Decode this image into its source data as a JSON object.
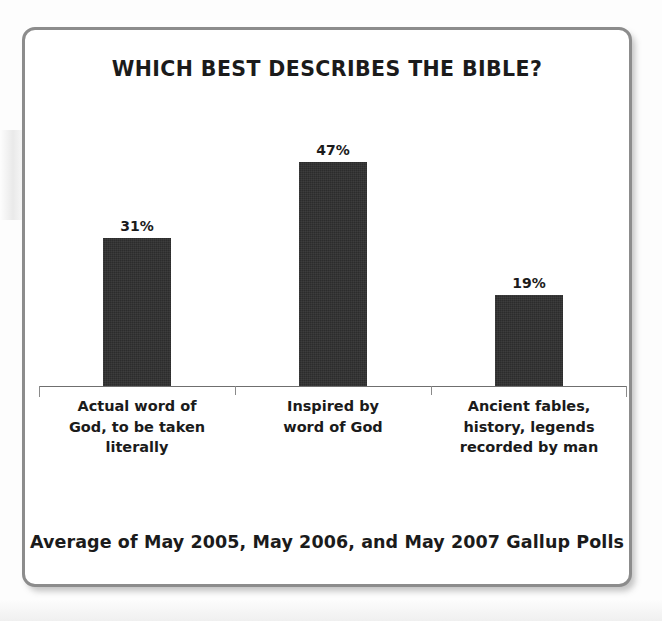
{
  "card": {
    "title": "WHICH BEST DESCRIBES THE BIBLE?",
    "footer": "Average of May 2005, May 2006, and May 2007 Gallup Polls"
  },
  "chart_data": {
    "type": "bar",
    "title": "WHICH BEST DESCRIBES THE BIBLE?",
    "subtitle": "Average of May 2005, May 2006, and May 2007 Gallup Polls",
    "xlabel": "",
    "ylabel": "",
    "ylim": [
      0,
      60
    ],
    "grid": false,
    "legend": false,
    "bar_color": "#2c2c2c",
    "axis_color": "#6f6f6f",
    "categories": [
      "Actual word of God, to be taken literally",
      "Inspired by word of God",
      "Ancient fables, history, legends recorded by man"
    ],
    "category_lines": [
      [
        "Actual word of",
        "God, to be taken",
        "literally"
      ],
      [
        "Inspired by",
        "word of God"
      ],
      [
        "Ancient fables,",
        "history, legends",
        "recorded by man"
      ]
    ],
    "values": [
      31,
      47,
      19
    ],
    "value_labels": [
      "31%",
      "47%",
      "19%"
    ]
  }
}
